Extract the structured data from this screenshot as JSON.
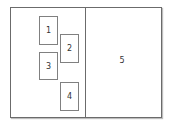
{
  "diagram": {
    "panels": [
      {
        "id": "left-panel"
      },
      {
        "id": "right-panel",
        "label": "5"
      }
    ],
    "boxes": [
      {
        "label": "1"
      },
      {
        "label": "2"
      },
      {
        "label": "3"
      },
      {
        "label": "4"
      }
    ]
  }
}
